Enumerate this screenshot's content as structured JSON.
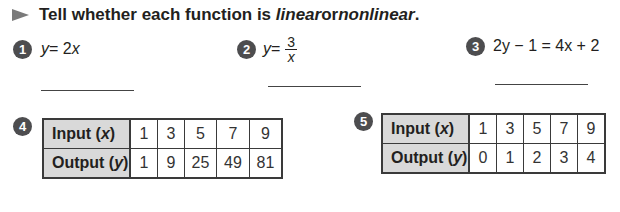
{
  "instruction": {
    "prefix": "Tell whether each function is ",
    "word1": "linear",
    "middle": " or ",
    "word2": "nonlinear",
    "suffix": "."
  },
  "problems": [
    {
      "number": "1",
      "lhs": "y",
      "rest": " = 2",
      "var": "x"
    },
    {
      "number": "2",
      "lhs": "y",
      "rest": " = ",
      "numerator": "3",
      "denominator": "x"
    },
    {
      "number": "3",
      "expression": "2y − 1 = 4x + 2"
    },
    {
      "number": "4",
      "table": {
        "row_labels": [
          {
            "text": "Input (",
            "var": "x",
            "close": ")"
          },
          {
            "text": "Output (",
            "var": "y",
            "close": ")"
          }
        ],
        "input": [
          "1",
          "3",
          "5",
          "7",
          "9"
        ],
        "output": [
          "1",
          "9",
          "25",
          "49",
          "81"
        ]
      }
    },
    {
      "number": "5",
      "table": {
        "row_labels": [
          {
            "text": "Input (",
            "var": "x",
            "close": ")"
          },
          {
            "text": "Output (",
            "var": "y",
            "close": ")"
          }
        ],
        "input": [
          "1",
          "3",
          "5",
          "7",
          "9"
        ],
        "output": [
          "0",
          "1",
          "2",
          "3",
          "4"
        ]
      }
    }
  ],
  "colors": {
    "number_badge": "#4d4d4f",
    "header_cell": "#d9d9d9",
    "arrow": "#7a7a7a"
  }
}
